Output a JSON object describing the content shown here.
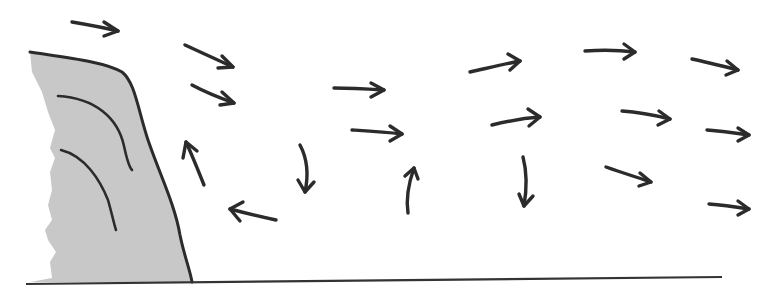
{
  "diagram": {
    "colors": {
      "background": "#ffffff",
      "ink": "#2b2b2b",
      "obstacle_fill": "#c8c8c8",
      "ground": "#333333"
    },
    "obstacle": {
      "label": "",
      "outline": "M30,52 C70,58 105,62 122,72 C135,82 138,110 148,140 C160,175 175,205 180,235 C184,255 190,270 192,282",
      "fill_path": "M30,52 C70,58 105,62 122,72 C135,82 138,110 148,140 C160,175 175,205 180,235 C184,255 190,270 192,282 L30,282 L52,278 L50,262 L56,252 L48,240 L45,230 L52,220 L48,205 L52,190 L50,172 L55,158 L50,148 L55,130 L48,112 L42,92 L32,72 Z",
      "strata": [
        "M58,96 C95,98 118,118 124,146 C127,160 130,168 132,170",
        "M61,150 C85,156 100,180 108,200 C112,214 114,224 116,230"
      ]
    },
    "ground": {
      "x1": 26,
      "y1": 284,
      "x2": 722,
      "y2": 277
    },
    "arrows": [
      {
        "id": "a1",
        "d": "M72,22 C90,25 105,28 118,31",
        "head": "M104,22 L118,31 L104,36"
      },
      {
        "id": "a2",
        "d": "M185,45 C200,52 218,60 233,67",
        "head": "M222,56 L233,67 L218,68"
      },
      {
        "id": "a3",
        "d": "M192,85 C205,92 220,98 234,103",
        "head": "M222,92 L234,103 L220,105"
      },
      {
        "id": "a4",
        "d": "M204,185 C198,170 192,155 186,142",
        "head": "M183,158 L186,142 L197,151"
      },
      {
        "id": "a5",
        "d": "M276,220 C262,217 245,213 230,209",
        "head": "M243,202 L230,209 L240,221"
      },
      {
        "id": "a6",
        "d": "M300,145 C308,160 308,178 305,192",
        "head": "M298,180 L305,192 L314,182"
      },
      {
        "id": "a7",
        "d": "M334,88 C350,88 368,89 384,90",
        "head": "M371,83 L384,90 L371,97"
      },
      {
        "id": "a8",
        "d": "M352,130 C368,131 385,132 402,134",
        "head": "M390,126 L402,134 L390,141"
      },
      {
        "id": "a9",
        "d": "M408,213 C406,200 408,185 414,168",
        "head": "M405,176 L414,168 L418,179"
      },
      {
        "id": "a10",
        "d": "M470,72 C488,68 505,64 520,61",
        "head": "M508,54 L520,61 L510,70"
      },
      {
        "id": "a11",
        "d": "M492,125 C508,121 525,118 540,117",
        "head": "M528,109 L540,117 L529,126"
      },
      {
        "id": "a12",
        "d": "M523,157 C527,172 527,188 524,206",
        "head": "M519,194 L524,206 L533,196"
      },
      {
        "id": "a13",
        "d": "M585,51 C600,50 618,50 635,52",
        "head": "M624,44 L635,52 L624,59"
      },
      {
        "id": "a14",
        "d": "M622,111 C638,112 654,115 670,119",
        "head": "M659,111 L670,119 L658,125"
      },
      {
        "id": "a15",
        "d": "M606,167 C620,172 636,177 651,182",
        "head": "M640,173 L651,182 L639,186"
      },
      {
        "id": "a16",
        "d": "M692,59 C706,62 722,66 738,70",
        "head": "M727,61 L738,70 L726,75"
      },
      {
        "id": "a17",
        "d": "M707,130 C720,131 735,133 749,135",
        "head": "M738,128 L749,135 L738,141"
      },
      {
        "id": "a18",
        "d": "M709,204 C722,205 736,207 749,209",
        "head": "M738,201 L749,209 L738,215"
      }
    ]
  }
}
